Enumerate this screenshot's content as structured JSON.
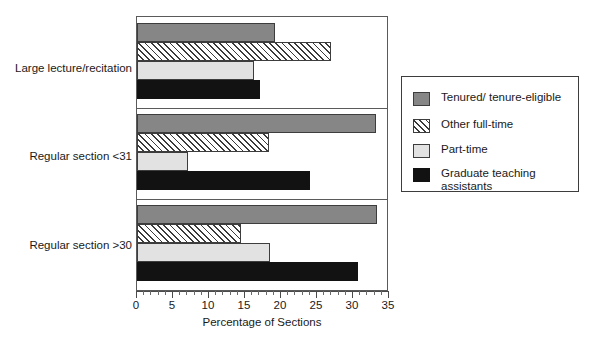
{
  "chart_data": {
    "type": "bar",
    "orientation": "horizontal",
    "title": "",
    "xlabel": "Percentage of Sections",
    "ylabel": "",
    "xlim": [
      0,
      35
    ],
    "xticks": [
      0,
      5,
      10,
      15,
      20,
      25,
      30,
      35
    ],
    "xtick_labels": [
      "0",
      "5",
      "10",
      "15",
      "20",
      "25",
      "30",
      "35"
    ],
    "minor_tick_step": 1,
    "grid": false,
    "legend_position": "right",
    "categories": [
      "Large lecture/recitation",
      "Regular section <31",
      "Regular section >30"
    ],
    "series": [
      {
        "name": "Tenured/ tenure-eligible",
        "legend_label": "Tenured/ tenure-eligible",
        "fill": "solid-gray",
        "color": "#868686",
        "values": [
          19.2,
          33.2,
          33.4
        ]
      },
      {
        "name": "Other full-time",
        "legend_label": "Other full-time",
        "fill": "diagonal-hatch",
        "color": "#ffffff",
        "values": [
          26.9,
          18.4,
          14.4
        ]
      },
      {
        "name": "Part-time",
        "legend_label": "Part-time",
        "fill": "solid-light-gray",
        "color": "#e2e2e2",
        "values": [
          16.3,
          7.1,
          18.5
        ]
      },
      {
        "name": "Graduate teaching assistants",
        "legend_label": "Graduate teaching\nassistants",
        "fill": "solid-black",
        "color": "#121212",
        "values": [
          17.1,
          24.0,
          30.7
        ]
      }
    ]
  }
}
